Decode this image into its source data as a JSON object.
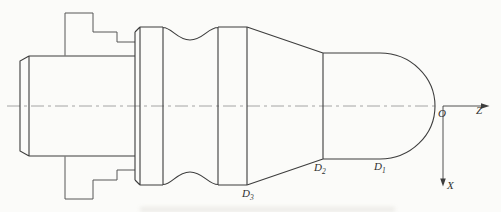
{
  "labels": {
    "d1": {
      "symbol": "D",
      "subscript": "1"
    },
    "d2": {
      "symbol": "D",
      "subscript": "2"
    },
    "d3": {
      "symbol": "D",
      "subscript": "3"
    },
    "origin": "O",
    "axis_z": "Z",
    "axis_x": "X"
  },
  "colors": {
    "background": "#fbfbf9",
    "outline": "#3d3d3d",
    "chuck": "#575757",
    "centerline": "#8f8f8f",
    "label": "#2f2f2f"
  }
}
